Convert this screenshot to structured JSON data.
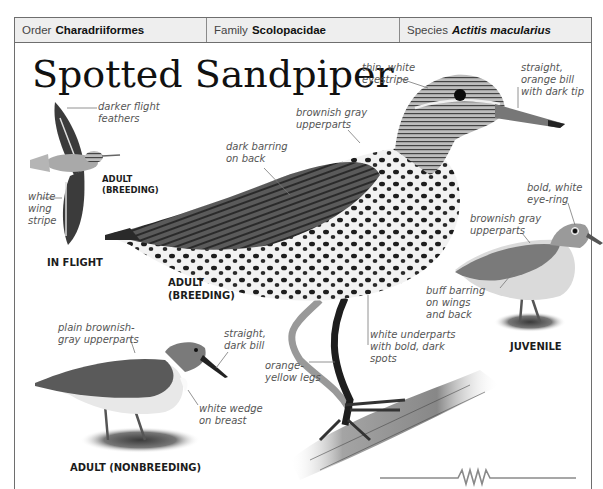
{
  "header": {
    "order": {
      "key": "Order",
      "value": "Charadriiformes"
    },
    "family": {
      "key": "Family",
      "value": "Scolopacidae"
    },
    "species": {
      "key": "Species",
      "value": "Actitis macularius"
    }
  },
  "title": "Spotted Sandpiper",
  "figures": {
    "in_flight": {
      "caption": "IN FLIGHT",
      "sub_caption": "ADULT\n(BREEDING)",
      "labels": {
        "flight_feathers": "darker flight\nfeathers",
        "wing_stripe": "white\nwing\nstripe"
      }
    },
    "adult_breeding": {
      "caption": "ADULT\n(BREEDING)",
      "labels": {
        "eyestripe": "thin, white\neyestripe",
        "bill": "straight,\norange bill\nwith dark tip",
        "upperparts": "brownish gray\nupperparts",
        "back": "dark barring\non back",
        "underparts": "white underparts\nwith bold, dark\nspots",
        "legs": "orange-\nyellow legs"
      }
    },
    "juvenile": {
      "caption": "JUVENILE",
      "labels": {
        "eye_ring": "bold, white\neye-ring",
        "upperparts": "brownish gray\nupperparts",
        "barring": "buff barring\non wings\nand back"
      }
    },
    "adult_nonbreeding": {
      "caption": "ADULT (NONBREEDING)",
      "labels": {
        "upperparts": "plain brownish-\ngray upperparts",
        "bill": "straight,\ndark bill",
        "breast": "white wedge\non breast"
      }
    }
  },
  "colors": {
    "header_bg": "#eeeeee",
    "border": "#6e6e6e",
    "label_text": "#555555",
    "caption_text": "#1c1c1c"
  }
}
